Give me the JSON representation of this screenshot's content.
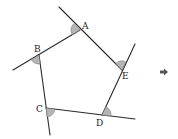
{
  "diagram": {
    "vertices": [
      {
        "label": "A"
      },
      {
        "label": "B"
      },
      {
        "label": "C"
      },
      {
        "label": "D"
      },
      {
        "label": "E"
      }
    ],
    "continuation_arrow": "right-arrow-icon",
    "colors": {
      "line": "#2a2a2a",
      "angle_fill": "#b5b5b5"
    }
  }
}
